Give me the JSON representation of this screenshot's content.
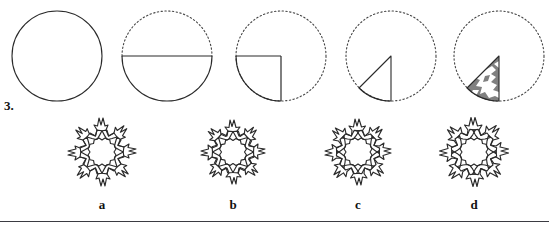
{
  "question": {
    "number": "3.",
    "type": "paper-folding-and-cutting"
  },
  "steps": {
    "caption": "",
    "items": [
      {
        "name": "step-full-circle",
        "description": "full circle, solid outline",
        "state": "unfolded-circle",
        "solid": "full-circle",
        "dashed": "none",
        "x": 7
      },
      {
        "name": "step-half-circle",
        "description": "circle folded in half; bottom half solid with solid diameter, top half dashed",
        "state": "folded-in-half",
        "solid": "bottom-semicircle-plus-diameter",
        "dashed": "top-semicircle",
        "x": 117
      },
      {
        "name": "step-quarter-circle",
        "description": "circle folded into quarter; lower-left quadrant solid, remainder dashed",
        "state": "folded-in-quarter",
        "solid": "lower-left-quadrant",
        "dashed": "full-circle-outline",
        "x": 231
      },
      {
        "name": "step-eighth-wedge",
        "description": "folded again into a narrow wedge/triangle with curved base; rest of circle dashed",
        "state": "folded-in-eighth",
        "solid": "wedge-triangle",
        "dashed": "full-circle-outline",
        "x": 341
      },
      {
        "name": "step-cut-wedge",
        "description": "the folded wedge shaded gray with white cut-out notches removed",
        "state": "cut-wedge",
        "solid": "wedge-triangle-with-cutouts",
        "fill": "gray",
        "dashed": "full-circle-outline",
        "x": 449
      }
    ]
  },
  "options": {
    "items": [
      {
        "label": "a",
        "name": "option-a",
        "description": "snowflake of eight linked human figures, long pointed arms",
        "variant": 1,
        "x": 52
      },
      {
        "label": "b",
        "name": "option-b",
        "description": "snowflake of eight linked human figures, shorter rounded arms",
        "variant": 2,
        "x": 183
      },
      {
        "label": "c",
        "name": "option-c",
        "description": "snowflake of eight linked human figures, splayed arms",
        "variant": 3,
        "x": 308
      },
      {
        "label": "d",
        "name": "option-d",
        "description": "snowflake of eight linked human figures, wide spiky arms",
        "variant": 4,
        "x": 424
      }
    ]
  },
  "colors": {
    "stroke": "#2a2a2a",
    "dashed_stroke": "#444444",
    "wedge_fill": "#808080",
    "cutout_fill": "#ffffff",
    "rule": "#3b3b42",
    "background": "#ffffff"
  }
}
